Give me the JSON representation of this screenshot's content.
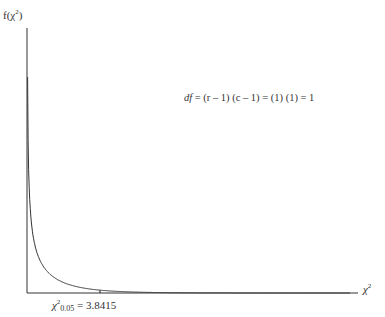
{
  "chart_data": {
    "type": "line",
    "title": "",
    "xlabel": "χ²",
    "ylabel": "f(χ²)",
    "series": [
      {
        "name": "Chi-square density, df = 1",
        "x": [
          0.05,
          0.2,
          0.5,
          1,
          1.5,
          2,
          3,
          3.8415,
          5,
          6,
          8,
          10,
          12
        ],
        "values": [
          1.76,
          0.85,
          0.44,
          0.24,
          0.15,
          0.1,
          0.05,
          0.03,
          0.015,
          0.008,
          0.0025,
          0.0009,
          0.0003
        ]
      }
    ],
    "annotations": [
      {
        "text": "df = (r − 1) (c − 1) = (1) (1) = 1"
      },
      {
        "text": "χ²0.05 = 3.8415",
        "x": 3.8415,
        "type": "vertical-line"
      }
    ],
    "grid": false,
    "legend": "none",
    "critical_value": 3.8415,
    "alpha": 0.05,
    "df": 1
  },
  "labels": {
    "y_axis_main": "f(χ",
    "y_axis_sup": "2",
    "y_axis_close": ")",
    "x_axis_main": "χ",
    "x_axis_sup": "2",
    "annot_df": "df",
    "annot_rest": " = (r – 1) (c – 1) = (1) (1) = 1",
    "crit_main": "χ",
    "crit_sup": "2",
    "crit_sub": "0.05",
    "crit_value": " = 3.8415"
  }
}
